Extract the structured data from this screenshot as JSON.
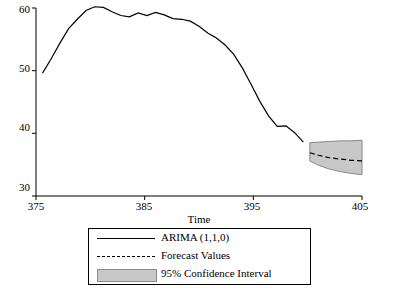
{
  "chart_data": {
    "type": "line",
    "title": "",
    "xlabel": "Time",
    "ylabel": "",
    "xlim": [
      375,
      405
    ],
    "ylim": [
      30,
      60
    ],
    "xticks": [
      375,
      385,
      395,
      405
    ],
    "yticks": [
      30,
      40,
      50,
      60
    ],
    "grid": false,
    "legend_position": "bottom",
    "series": [
      {
        "name": "ARIMA (1,1,0)",
        "style": "solid",
        "x": [
          375.6,
          376.4,
          377.2,
          378.0,
          378.8,
          379.6,
          380.4,
          381.2,
          382.0,
          382.8,
          383.6,
          384.4,
          385.2,
          386.0,
          386.8,
          387.6,
          388.4,
          389.2,
          390.0,
          390.8,
          391.6,
          392.4,
          393.2,
          394.0,
          394.8,
          395.6,
          396.4,
          397.2,
          398.0,
          398.8,
          399.6
        ],
        "y": [
          49.6,
          51.9,
          54.4,
          56.7,
          58.2,
          59.6,
          60.2,
          60.1,
          59.4,
          58.8,
          58.6,
          59.2,
          58.8,
          59.3,
          58.9,
          58.3,
          58.2,
          57.9,
          57.1,
          56.0,
          55.2,
          54.1,
          52.6,
          50.4,
          47.8,
          45.1,
          42.8,
          41.1,
          41.2,
          40.1,
          38.6
        ]
      },
      {
        "name": "Forecast Values",
        "style": "dashed",
        "x": [
          400.2,
          401.0,
          402.0,
          403.0,
          404.0,
          405.0
        ],
        "y": [
          36.9,
          36.5,
          36.1,
          35.9,
          35.7,
          35.6
        ]
      }
    ],
    "confidence_band": {
      "name": "95% Confidence Interval",
      "level": "95%",
      "x": [
        400.2,
        401.0,
        402.0,
        403.0,
        404.0,
        405.0
      ],
      "lower": [
        35.6,
        34.9,
        34.3,
        33.9,
        33.6,
        33.4
      ],
      "upper": [
        38.5,
        38.6,
        38.7,
        38.8,
        38.8,
        38.9
      ],
      "color": "#c8c8c8"
    }
  },
  "legend": {
    "items": [
      {
        "label": "ARIMA (1,1,0)",
        "marker": "solid-line"
      },
      {
        "label": "Forecast Values",
        "marker": "dashed-line"
      },
      {
        "label": "95% Confidence Interval",
        "marker": "gray-band"
      }
    ]
  },
  "axes": {
    "x_title": "Time",
    "x_tick_labels": [
      "375",
      "385",
      "395",
      "405"
    ],
    "y_tick_labels": [
      "30",
      "40",
      "50",
      "60"
    ]
  },
  "colors": {
    "line": "#000000",
    "band": "#c8c8c8",
    "band_border": "#8a8a8a",
    "axis": "#000000",
    "background": "#ffffff"
  }
}
